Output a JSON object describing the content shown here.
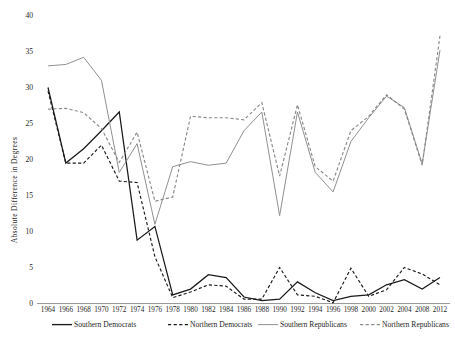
{
  "chart_data": {
    "type": "line",
    "title": "",
    "xlabel": "",
    "ylabel": "Absolute  Difference  in  Degrees",
    "ylim": [
      0,
      40
    ],
    "yticks": [
      0,
      5,
      10,
      15,
      20,
      25,
      30,
      35,
      40
    ],
    "grid": false,
    "legend_position": "bottom",
    "categories": [
      "1964",
      "1966",
      "1968",
      "1970",
      "1972",
      "1974",
      "1976",
      "1978",
      "1980",
      "1982",
      "1984",
      "1986",
      "1988",
      "1990",
      "1992",
      "1994",
      "1996",
      "1998",
      "2000",
      "2002",
      "2004",
      "2008",
      "2012"
    ],
    "series": [
      {
        "name": "Southern Democrats",
        "color": "#1a1a1a",
        "style": "solid",
        "values": [
          30.0,
          19.5,
          21.5,
          24.0,
          26.6,
          8.8,
          10.7,
          1.2,
          2.0,
          4.0,
          3.6,
          0.9,
          0.4,
          0.6,
          3.0,
          1.5,
          0.4,
          1.0,
          1.2,
          2.6,
          3.3,
          2.0,
          3.6
        ]
      },
      {
        "name": "Northern Democrats",
        "color": "#1a1a1a",
        "style": "dashed",
        "values": [
          29.5,
          19.5,
          19.5,
          22.0,
          17.0,
          16.8,
          6.5,
          0.8,
          1.6,
          2.6,
          2.4,
          0.6,
          0.6,
          5.0,
          1.2,
          1.0,
          0.1,
          4.9,
          1.0,
          1.9,
          5.0,
          4.1,
          2.6
        ]
      },
      {
        "name": "Southern Republicans",
        "color": "#8a8a8a",
        "style": "solid",
        "values": [
          33.0,
          33.2,
          34.2,
          31.0,
          18.2,
          22.2,
          11.0,
          19.0,
          19.7,
          19.2,
          19.5,
          24.0,
          26.6,
          12.2,
          26.6,
          18.2,
          15.5,
          22.5,
          25.8,
          28.8,
          27.2,
          19.4,
          35.2
        ]
      },
      {
        "name": "Northern Republicans",
        "color": "#8a8a8a",
        "style": "dashed",
        "values": [
          27.0,
          27.1,
          26.5,
          24.3,
          19.6,
          23.8,
          14.2,
          14.8,
          26.0,
          25.8,
          25.8,
          25.5,
          27.9,
          17.7,
          27.6,
          19.0,
          17.0,
          24.0,
          26.0,
          29.0,
          27.0,
          19.2,
          37.2
        ]
      }
    ]
  },
  "legend": {
    "items": [
      {
        "label": "Southern Democrats",
        "color": "#1a1a1a",
        "style": "solid"
      },
      {
        "label": "Northern Democrats",
        "color": "#1a1a1a",
        "style": "dashed"
      },
      {
        "label": "Southern Republicans",
        "color": "#8a8a8a",
        "style": "solid"
      },
      {
        "label": "Northern Republicans",
        "color": "#8a8a8a",
        "style": "dashed"
      }
    ]
  }
}
